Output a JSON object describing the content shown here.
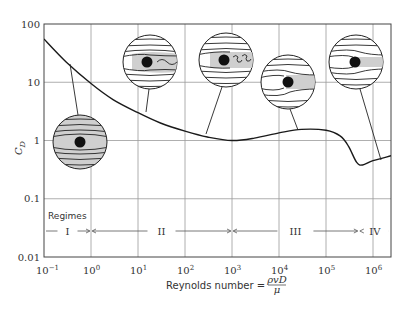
{
  "chart_data": {
    "type": "line",
    "title": "",
    "xlabel": "Reynolds number = ρvD/μ",
    "xlabel_prefix": "Reynolds number = ",
    "xlabel_num": "ρvD",
    "xlabel_den": "μ",
    "ylabel": "C_D",
    "ylabel_main": "C",
    "ylabel_sub": "D",
    "x_scale": "log",
    "y_scale": "log",
    "xlim": [
      0.1,
      2500000
    ],
    "ylim": [
      0.01,
      100
    ],
    "grid": true,
    "x_ticks": [
      {
        "base": "10",
        "exp": "−1",
        "value": 0.1
      },
      {
        "base": "10",
        "exp": "0",
        "value": 1
      },
      {
        "base": "10",
        "exp": "1",
        "value": 10
      },
      {
        "base": "10",
        "exp": "2",
        "value": 100
      },
      {
        "base": "10",
        "exp": "3",
        "value": 1000
      },
      {
        "base": "10",
        "exp": "4",
        "value": 10000
      },
      {
        "base": "10",
        "exp": "5",
        "value": 100000
      },
      {
        "base": "10",
        "exp": "6",
        "value": 1000000
      }
    ],
    "y_ticks": [
      {
        "label": "100",
        "value": 100
      },
      {
        "label": "10",
        "value": 10
      },
      {
        "label": "1",
        "value": 1
      },
      {
        "label": "0.1",
        "value": 0.1
      },
      {
        "label": "0.01",
        "value": 0.01
      }
    ],
    "series": [
      {
        "name": "Drag coefficient of a sphere",
        "x": [
          0.1,
          0.3,
          1,
          3,
          10,
          30,
          100,
          300,
          1000,
          3000,
          10000,
          30000,
          100000,
          200000,
          300000,
          450000,
          600000,
          1000000,
          2500000
        ],
        "values": [
          55,
          22,
          9.5,
          5.0,
          3.0,
          2.0,
          1.45,
          1.15,
          1.0,
          1.1,
          1.35,
          1.55,
          1.5,
          1.2,
          0.8,
          0.42,
          0.38,
          0.45,
          0.55
        ]
      }
    ],
    "regimes": {
      "label": "Regimes",
      "items": [
        {
          "label": "I",
          "from": 0.1,
          "to": 1
        },
        {
          "label": "II",
          "from": 1,
          "to": 1000
        },
        {
          "label": "III",
          "from": 1000,
          "to": 500000
        },
        {
          "label": "IV",
          "from": 500000,
          "to": 2500000
        }
      ]
    },
    "annotations": [
      {
        "name": "flow-inset-creeping",
        "description": "Symmetric streamlines around sphere, attached flow",
        "points_to": {
          "Re": 0.3,
          "Cd": 22
        }
      },
      {
        "name": "flow-inset-wavy-wake",
        "description": "Wavy laminar wake behind sphere",
        "points_to": {
          "Re": 30,
          "Cd": 2.0
        }
      },
      {
        "name": "flow-inset-vortex-shedding",
        "description": "Vortex shedding wake",
        "points_to": {
          "Re": 700,
          "Cd": 1.05
        }
      },
      {
        "name": "flow-inset-wide-wake",
        "description": "Wide turbulent wake (laminar boundary layer)",
        "points_to": {
          "Re": 30000,
          "Cd": 1.55
        }
      },
      {
        "name": "flow-inset-narrow-wake",
        "description": "Narrow wake (turbulent boundary layer)",
        "points_to": {
          "Re": 1500000,
          "Cd": 0.5
        }
      }
    ]
  }
}
